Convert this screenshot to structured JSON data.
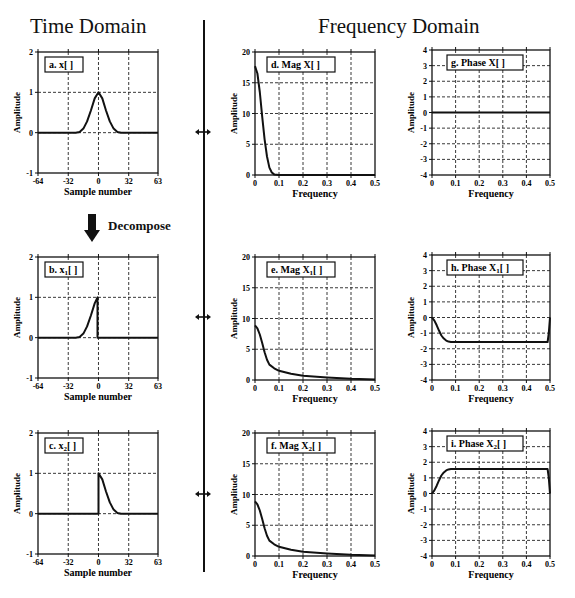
{
  "headings": {
    "time": "Time Domain",
    "frequency": "Frequency Domain"
  },
  "decompose_label": "Decompose",
  "chart_data": [
    {
      "id": "a",
      "type": "line",
      "title": "a.  x[ ]",
      "title_main": "a.  x[ ]",
      "subscript": "",
      "xlabel": "Sample number",
      "ylabel": "Amplitude",
      "xlim": [
        -64,
        63
      ],
      "ylim": [
        -1,
        2
      ],
      "xticks": [
        -64,
        -32,
        0,
        32,
        63
      ],
      "yticks": [
        -1,
        0,
        1,
        2
      ],
      "grid": true,
      "x": [
        -64,
        -24,
        -20,
        -16,
        -12,
        -8,
        -4,
        0,
        4,
        8,
        12,
        16,
        20,
        24,
        63
      ],
      "y": [
        0,
        0,
        0.02,
        0.1,
        0.28,
        0.55,
        0.85,
        1.0,
        0.85,
        0.55,
        0.28,
        0.1,
        0.02,
        0,
        0
      ]
    },
    {
      "id": "b",
      "type": "line",
      "title_main": "b.  x",
      "subscript": "1",
      "title_tail": "[ ]",
      "xlabel": "Sample number",
      "ylabel": "Amplitude",
      "xlim": [
        -64,
        63
      ],
      "ylim": [
        -1,
        2
      ],
      "xticks": [
        -64,
        -32,
        0,
        32,
        63
      ],
      "yticks": [
        -1,
        0,
        1,
        2
      ],
      "grid": true,
      "x": [
        -64,
        -24,
        -20,
        -16,
        -12,
        -8,
        -4,
        -1,
        -1,
        63
      ],
      "y": [
        0,
        0,
        0.02,
        0.1,
        0.28,
        0.55,
        0.85,
        1.0,
        0,
        0
      ]
    },
    {
      "id": "c",
      "type": "line",
      "title_main": "c.  x",
      "subscript": "2",
      "title_tail": "[ ]",
      "xlabel": "Sample number",
      "ylabel": "Amplitude",
      "xlim": [
        -64,
        63
      ],
      "ylim": [
        -1,
        2
      ],
      "xticks": [
        -64,
        -32,
        0,
        32,
        63
      ],
      "yticks": [
        -1,
        0,
        1,
        2
      ],
      "grid": true,
      "x": [
        -64,
        0,
        0,
        4,
        8,
        12,
        16,
        20,
        24,
        63
      ],
      "y": [
        0,
        0,
        1.0,
        0.85,
        0.55,
        0.28,
        0.1,
        0.02,
        0,
        0
      ]
    },
    {
      "id": "d",
      "type": "line",
      "title_main": "d.  Mag X",
      "subscript": "",
      "title_tail": "[ ]",
      "xlabel": "Frequency",
      "ylabel": "Amplitude",
      "xlim": [
        0,
        0.5
      ],
      "ylim": [
        0,
        20
      ],
      "xticks": [
        0,
        0.1,
        0.2,
        0.3,
        0.4,
        0.5
      ],
      "yticks": [
        0,
        5,
        10,
        15,
        20
      ],
      "grid": true,
      "x": [
        0,
        0.01,
        0.02,
        0.03,
        0.04,
        0.05,
        0.06,
        0.07,
        0.08,
        0.1,
        0.5
      ],
      "y": [
        17.7,
        16.5,
        13.5,
        9.5,
        5.8,
        3.0,
        1.2,
        0.4,
        0.1,
        0,
        0
      ]
    },
    {
      "id": "e",
      "type": "line",
      "title_main": "e.  Mag X",
      "subscript": "1",
      "title_tail": "[ ]",
      "xlabel": "Frequency",
      "ylabel": "Amplitude",
      "xlim": [
        0,
        0.5
      ],
      "ylim": [
        0,
        20
      ],
      "xticks": [
        0,
        0.1,
        0.2,
        0.3,
        0.4,
        0.5
      ],
      "yticks": [
        0,
        5,
        10,
        15,
        20
      ],
      "grid": true,
      "x": [
        0,
        0.01,
        0.02,
        0.03,
        0.04,
        0.05,
        0.06,
        0.08,
        0.1,
        0.15,
        0.2,
        0.3,
        0.4,
        0.5
      ],
      "y": [
        8.9,
        8.4,
        7.4,
        6.0,
        4.5,
        3.3,
        2.5,
        1.9,
        1.5,
        1.0,
        0.7,
        0.4,
        0.2,
        0.1
      ]
    },
    {
      "id": "f",
      "type": "line",
      "title_main": "f.  Mag X",
      "subscript": "2",
      "title_tail": "[ ]",
      "xlabel": "Frequency",
      "ylabel": "Amplitude",
      "xlim": [
        0,
        0.5
      ],
      "ylim": [
        0,
        20
      ],
      "xticks": [
        0,
        0.1,
        0.2,
        0.3,
        0.4,
        0.5
      ],
      "yticks": [
        0,
        5,
        10,
        15,
        20
      ],
      "grid": true,
      "x": [
        0,
        0.01,
        0.02,
        0.03,
        0.04,
        0.05,
        0.06,
        0.08,
        0.1,
        0.15,
        0.2,
        0.3,
        0.4,
        0.5
      ],
      "y": [
        8.9,
        8.4,
        7.4,
        6.0,
        4.5,
        3.3,
        2.5,
        1.9,
        1.5,
        1.0,
        0.7,
        0.4,
        0.2,
        0.1
      ]
    },
    {
      "id": "g",
      "type": "line",
      "title_main": "g.  Phase X",
      "subscript": "",
      "title_tail": "[ ]",
      "xlabel": "Frequency",
      "ylabel": "Amplitude",
      "xlim": [
        0,
        0.5
      ],
      "ylim": [
        -4,
        4
      ],
      "xticks": [
        0,
        0.1,
        0.2,
        0.3,
        0.4,
        0.5
      ],
      "yticks": [
        -4,
        -3,
        -2,
        -1,
        0,
        1,
        2,
        3,
        4
      ],
      "grid": true,
      "x": [
        0,
        0.5
      ],
      "y": [
        0,
        0
      ]
    },
    {
      "id": "h",
      "type": "line",
      "title_main": "h.  Phase X",
      "subscript": "1",
      "title_tail": "[ ]",
      "xlabel": "Frequency",
      "ylabel": "Amplitude",
      "xlim": [
        0,
        0.5
      ],
      "ylim": [
        -4,
        4
      ],
      "xticks": [
        0,
        0.1,
        0.2,
        0.3,
        0.4,
        0.5
      ],
      "yticks": [
        -4,
        -3,
        -2,
        -1,
        0,
        1,
        2,
        3,
        4
      ],
      "grid": true,
      "x": [
        0,
        0.01,
        0.02,
        0.03,
        0.04,
        0.05,
        0.06,
        0.07,
        0.08,
        0.1,
        0.49,
        0.495,
        0.5
      ],
      "y": [
        0,
        -0.2,
        -0.5,
        -0.85,
        -1.15,
        -1.35,
        -1.48,
        -1.54,
        -1.57,
        -1.57,
        -1.57,
        -1.0,
        0
      ]
    },
    {
      "id": "i",
      "type": "line",
      "title_main": "i.  Phase X",
      "subscript": "2",
      "title_tail": "[ ]",
      "xlabel": "Frequency",
      "ylabel": "Amplitude",
      "xlim": [
        0,
        0.5
      ],
      "ylim": [
        -4,
        4
      ],
      "xticks": [
        0,
        0.1,
        0.2,
        0.3,
        0.4,
        0.5
      ],
      "yticks": [
        -4,
        -3,
        -2,
        -1,
        0,
        1,
        2,
        3,
        4
      ],
      "grid": true,
      "x": [
        0,
        0.01,
        0.02,
        0.03,
        0.04,
        0.05,
        0.06,
        0.07,
        0.08,
        0.1,
        0.49,
        0.495,
        0.5
      ],
      "y": [
        0,
        0.2,
        0.5,
        0.85,
        1.15,
        1.35,
        1.48,
        1.54,
        1.57,
        1.57,
        1.57,
        1.0,
        0
      ]
    }
  ]
}
